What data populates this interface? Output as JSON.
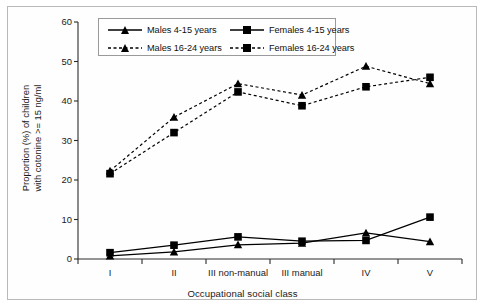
{
  "chart_data": {
    "type": "line",
    "title": "",
    "subtitle": "",
    "xlabel": "Occupational social class",
    "ylabel": "Proportion (%) of children with cotonine >= 15 ng/ml",
    "ylabel_lines": [
      "Proportion (%) of children",
      "with cotonine >= 15 ng/ml"
    ],
    "categories": [
      "I",
      "II",
      "III non-manual",
      "III manual",
      "IV",
      "V"
    ],
    "ylim": [
      0,
      60
    ],
    "yticks": [
      0,
      10,
      20,
      30,
      40,
      50,
      60
    ],
    "grid": false,
    "legend_position": "top-center-inside",
    "series": [
      {
        "name": "Males 4-15 years",
        "marker": "triangle",
        "line": "solid",
        "values": [
          0.8,
          1.8,
          3.6,
          4.0,
          6.6,
          4.4
        ]
      },
      {
        "name": "Females 4-15 years",
        "marker": "square",
        "line": "solid",
        "values": [
          1.6,
          3.5,
          5.6,
          4.5,
          4.7,
          10.6
        ]
      },
      {
        "name": "Males 16-24 years",
        "marker": "triangle",
        "line": "dashed",
        "values": [
          22.3,
          35.9,
          44.4,
          41.5,
          48.8,
          44.4
        ]
      },
      {
        "name": "Females 16-24 years",
        "marker": "square",
        "line": "dashed",
        "values": [
          21.6,
          32.0,
          42.3,
          38.8,
          43.6,
          46.0
        ]
      }
    ],
    "colors": {
      "series": "#000000",
      "axis": "#1a1a1a",
      "frame": "#b9b9b9",
      "legend_border": "#9a9a9a",
      "background": "#ffffff"
    }
  },
  "legend": {
    "entries": [
      {
        "label": "Males 4-15 years",
        "marker": "triangle-icon",
        "line": "solid"
      },
      {
        "label": "Females 4-15 years",
        "marker": "square-icon",
        "line": "solid"
      },
      {
        "label": "Males 16-24 years",
        "marker": "triangle-icon",
        "line": "dashed"
      },
      {
        "label": "Females 16-24 years",
        "marker": "square-icon",
        "line": "dashed"
      }
    ]
  },
  "axes": {
    "y_tick_labels": [
      "60",
      "50",
      "40",
      "30",
      "20",
      "10",
      "0"
    ],
    "x_tick_labels": [
      "I",
      "II",
      "III non-manual",
      "III manual",
      "IV",
      "V"
    ]
  }
}
